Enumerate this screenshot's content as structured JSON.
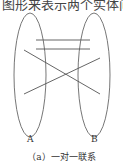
{
  "header_text": "图形来表示两个实体间",
  "diagram": {
    "set_a_label": "A",
    "set_b_label": "B",
    "caption": "（a）一对一联系",
    "line_color": "#555555"
  }
}
